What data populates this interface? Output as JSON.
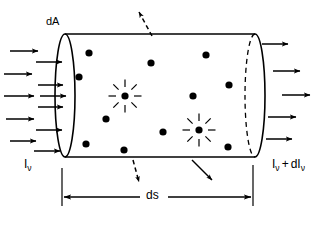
{
  "figure": {
    "type": "physics-schematic",
    "stroke_color": "#000000",
    "background_color": "#ffffff"
  },
  "labels": {
    "area_element": {
      "text": "dA",
      "meaning": "differential cross-sectional area of the cylinder end face",
      "x": 46,
      "y": 16
    },
    "intensity_in": {
      "base": "I",
      "subscript": "ν",
      "text": "Iν",
      "meaning": "incident specific intensity at frequency nu",
      "x": 24,
      "y": 158
    },
    "intensity_out": {
      "base": "I",
      "subscript": "ν",
      "plus": "+",
      "delta_base": "dI",
      "delta_subscript": "ν",
      "text": "Iν + dIν",
      "meaning": "emergent specific intensity after traversing the slab",
      "x": 272,
      "y": 158
    },
    "path_length": {
      "text": "ds",
      "meaning": "differential path length along the beam",
      "x": 146,
      "y": 189
    }
  },
  "cylinder": {
    "body_left_x": 65,
    "body_right_x": 255,
    "top_y": 34,
    "bottom_y": 157,
    "front_face": {
      "name": "left-end-ellipse",
      "cx": 65,
      "cy": 95.5,
      "rx": 10,
      "ry": 61.5,
      "style": "solid"
    },
    "back_face": {
      "name": "right-end-ellipse",
      "cx": 255,
      "cy": 95.5,
      "rx": 10,
      "ry": 61.5,
      "front_half_style": "solid",
      "back_half_style": "dashed"
    }
  },
  "incoming_beam": {
    "label": "incident radiation arrows",
    "count_outer": 5,
    "count_inner": 6,
    "direction": "rightward",
    "outer_arrows": [
      {
        "x1": 10,
        "y1": 51,
        "x2": 38,
        "y2": 51
      },
      {
        "x1": 4,
        "y1": 74,
        "x2": 32,
        "y2": 74
      },
      {
        "x1": 4,
        "y1": 96,
        "x2": 34,
        "y2": 96
      },
      {
        "x1": 6,
        "y1": 119,
        "x2": 34,
        "y2": 119
      },
      {
        "x1": 10,
        "y1": 141,
        "x2": 36,
        "y2": 141
      }
    ],
    "inner_arrows": [
      {
        "x1": 36,
        "y1": 62,
        "x2": 62,
        "y2": 62
      },
      {
        "x1": 38,
        "y1": 85,
        "x2": 63,
        "y2": 85
      },
      {
        "x1": 40,
        "y1": 96,
        "x2": 66,
        "y2": 96
      },
      {
        "x1": 38,
        "y1": 107,
        "x2": 63,
        "y2": 107
      },
      {
        "x1": 36,
        "y1": 130,
        "x2": 62,
        "y2": 130
      },
      {
        "x1": 34,
        "y1": 151,
        "x2": 60,
        "y2": 151
      }
    ]
  },
  "outgoing_beam": {
    "label": "emergent radiation arrows",
    "count": 5,
    "direction": "rightward",
    "arrows": [
      {
        "x1": 262,
        "y1": 44,
        "x2": 288,
        "y2": 44
      },
      {
        "x1": 273,
        "y1": 71,
        "x2": 300,
        "y2": 71
      },
      {
        "x1": 282,
        "y1": 95,
        "x2": 310,
        "y2": 95
      },
      {
        "x1": 268,
        "y1": 117,
        "x2": 296,
        "y2": 117
      },
      {
        "x1": 266,
        "y1": 139,
        "x2": 292,
        "y2": 139
      }
    ]
  },
  "scattering_centers": {
    "label": "absorbing / scattering particles",
    "glyph": "filled-circle",
    "radius": 3.6,
    "positions": [
      {
        "x": 89,
        "y": 53
      },
      {
        "x": 151,
        "y": 63
      },
      {
        "x": 206,
        "y": 55
      },
      {
        "x": 79,
        "y": 77
      },
      {
        "x": 229,
        "y": 85
      },
      {
        "x": 193,
        "y": 96
      },
      {
        "x": 106,
        "y": 119
      },
      {
        "x": 163,
        "y": 132
      },
      {
        "x": 86,
        "y": 144
      },
      {
        "x": 124,
        "y": 150
      },
      {
        "x": 228,
        "y": 147
      }
    ]
  },
  "emission_sources": {
    "label": "emitting sources (starburst glyph)",
    "glyph": "starburst",
    "ray_count": 8,
    "core_radius": 3.6,
    "positions": [
      {
        "x": 125,
        "y": 96
      },
      {
        "x": 199,
        "y": 130
      }
    ]
  },
  "escaping_photons": {
    "label": "photons scattered/emitted out of the beam",
    "arrows": [
      {
        "name": "escape-arrow-top",
        "x1": 152,
        "y1": 36,
        "x2": 139,
        "y2": 12,
        "style": "dashed"
      },
      {
        "name": "escape-arrow-bottom-left",
        "x1": 133,
        "y1": 160,
        "x2": 139,
        "y2": 182,
        "style": "dashed"
      },
      {
        "name": "escape-arrow-bottom-right",
        "x1": 192,
        "y1": 160,
        "x2": 212,
        "y2": 180,
        "style": "solid"
      }
    ]
  },
  "dimension_line": {
    "name": "ds-dimension",
    "y": 197,
    "x_left": 62,
    "x_right": 253,
    "left_extension": {
      "x": 62,
      "y1": 168,
      "y2": 206
    },
    "right_extension": {
      "x": 253,
      "y1": 165,
      "y2": 206
    },
    "gap_left": 140,
    "gap_right": 168,
    "arrowheads": "both-ends-inward"
  }
}
